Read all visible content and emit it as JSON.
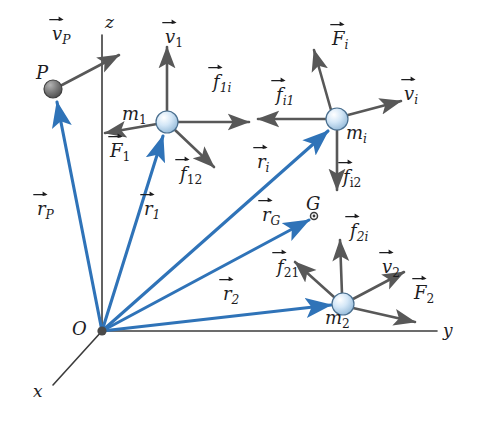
{
  "figure": {
    "background_color": "#ffffff",
    "colors": {
      "position_vector": "#2f73b8",
      "force_vector": "#585858",
      "axis": "#3c3c3c",
      "particle_fill": "#cfe4f5",
      "particle_stroke": "#4a6f8f",
      "point_P_fill": "#6b6b6b",
      "text": "#1d1d1f"
    },
    "axes": [
      {
        "name": "z-axis",
        "label": "z",
        "label_x": 105,
        "label_y": 14,
        "from": [
          102,
          331
        ],
        "to": [
          102,
          35
        ]
      },
      {
        "name": "y-axis",
        "label": "y",
        "label_x": 443,
        "label_y": 322,
        "from": [
          102,
          331
        ],
        "to": [
          437,
          331
        ]
      },
      {
        "name": "x-axis",
        "label": "x",
        "label_x": 33,
        "label_y": 383,
        "from": [
          102,
          331
        ],
        "to": [
          53,
          385
        ]
      }
    ],
    "origin": {
      "label": "O",
      "label_x": 72,
      "label_y": 320,
      "x": 102,
      "y": 331
    },
    "points": [
      {
        "name": "particle-P",
        "label": "P",
        "label_x": 36,
        "label_y": 64,
        "x": 53,
        "y": 89,
        "type": "dark-sphere",
        "r": 9
      },
      {
        "name": "particle-m1",
        "label_base": "m",
        "label_sub": "1",
        "label_x": 122,
        "label_y": 105,
        "x": 167,
        "y": 122,
        "type": "light-sphere",
        "r": 11
      },
      {
        "name": "particle-mi",
        "label_base": "m",
        "label_sub": "i",
        "label_x": 346,
        "label_y": 124,
        "x": 337,
        "y": 119,
        "type": "light-sphere",
        "r": 11
      },
      {
        "name": "particle-m2",
        "label_base": "m",
        "label_sub": "2",
        "label_x": 325,
        "label_y": 309,
        "x": 343,
        "y": 304,
        "type": "light-sphere",
        "r": 11
      },
      {
        "name": "center-of-mass-G",
        "label": "G",
        "label_x": 306,
        "label_y": 195,
        "x": 314,
        "y": 216,
        "type": "tiny-circle",
        "r": 3.5
      }
    ],
    "position_vectors": [
      {
        "name": "r-P",
        "base": "r",
        "sub": "P",
        "label_x": 37,
        "label_y": 200,
        "from": [
          102,
          331
        ],
        "to": [
          57,
          102
        ]
      },
      {
        "name": "r-1",
        "base": "r",
        "sub": "1",
        "label_x": 144,
        "label_y": 200,
        "from": [
          102,
          331
        ],
        "to": [
          163,
          136
        ]
      },
      {
        "name": "r-i",
        "base": "r",
        "sub": "i",
        "label_x": 257,
        "label_y": 153,
        "from": [
          102,
          331
        ],
        "to": [
          328,
          131
        ]
      },
      {
        "name": "r-G",
        "base": "r",
        "sub": "G",
        "label_x": 262,
        "label_y": 206,
        "from": [
          102,
          331
        ],
        "to": [
          309,
          220
        ]
      },
      {
        "name": "r-2",
        "base": "r",
        "sub": "2",
        "label_x": 223,
        "label_y": 285,
        "from": [
          102,
          331
        ],
        "to": [
          331,
          305
        ]
      }
    ],
    "force_vectors": [
      {
        "name": "v-P",
        "base": "v",
        "sub": "P",
        "sub_italic": true,
        "label_x": 52,
        "label_y": 25,
        "from": [
          62,
          85
        ],
        "to": [
          119,
          55
        ]
      },
      {
        "name": "v-1",
        "base": "v",
        "sub": "1",
        "sub_italic": false,
        "label_x": 165,
        "label_y": 28,
        "from": [
          167,
          112
        ],
        "to": [
          167,
          47
        ]
      },
      {
        "name": "f-1i",
        "base": "f",
        "sub": "1i",
        "sub_italic": true,
        "label_x": 213,
        "label_y": 73,
        "from": [
          178,
          122
        ],
        "to": [
          249,
          122
        ]
      },
      {
        "name": "F-1",
        "base": "F",
        "sub": "1",
        "sub_italic": false,
        "label_x": 110,
        "label_y": 142,
        "from": [
          157,
          124
        ],
        "to": [
          105,
          133
        ]
      },
      {
        "name": "f-12",
        "base": "f",
        "sub": "12",
        "sub_italic": false,
        "label_x": 180,
        "label_y": 165,
        "from": [
          175,
          130
        ],
        "to": [
          214,
          167
        ]
      },
      {
        "name": "F-i",
        "base": "F",
        "sub": "i",
        "sub_italic": true,
        "label_x": 332,
        "label_y": 30,
        "from": [
          331,
          110
        ],
        "to": [
          314,
          50
        ]
      },
      {
        "name": "f-i1",
        "base": "f",
        "sub": "i1",
        "sub_italic": true,
        "label_x": 276,
        "label_y": 86,
        "from": [
          327,
          119
        ],
        "to": [
          258,
          119
        ]
      },
      {
        "name": "v-i",
        "base": "v",
        "sub": "i",
        "sub_italic": true,
        "label_x": 404,
        "label_y": 85,
        "from": [
          348,
          115
        ],
        "to": [
          401,
          101
        ]
      },
      {
        "name": "f-i2",
        "base": "f",
        "sub": "i2",
        "sub_italic": false,
        "label_x": 343,
        "label_y": 168,
        "from": [
          337,
          130
        ],
        "to": [
          337,
          190
        ]
      },
      {
        "name": "f-2i",
        "base": "f",
        "sub": "2i",
        "sub_italic": true,
        "label_x": 350,
        "label_y": 222,
        "from": [
          342,
          294
        ],
        "to": [
          340,
          240
        ]
      },
      {
        "name": "f-21",
        "base": "f",
        "sub": "21",
        "sub_italic": false,
        "label_x": 277,
        "label_y": 258,
        "from": [
          334,
          297
        ],
        "to": [
          295,
          262
        ]
      },
      {
        "name": "v-2",
        "base": "v",
        "sub": "2",
        "sub_italic": false,
        "label_x": 382,
        "label_y": 258,
        "from": [
          353,
          299
        ],
        "to": [
          404,
          272
        ]
      },
      {
        "name": "F-2",
        "base": "F",
        "sub": "2",
        "sub_italic": false,
        "label_x": 414,
        "label_y": 284,
        "from": [
          353,
          308
        ],
        "to": [
          415,
          322
        ]
      }
    ]
  }
}
